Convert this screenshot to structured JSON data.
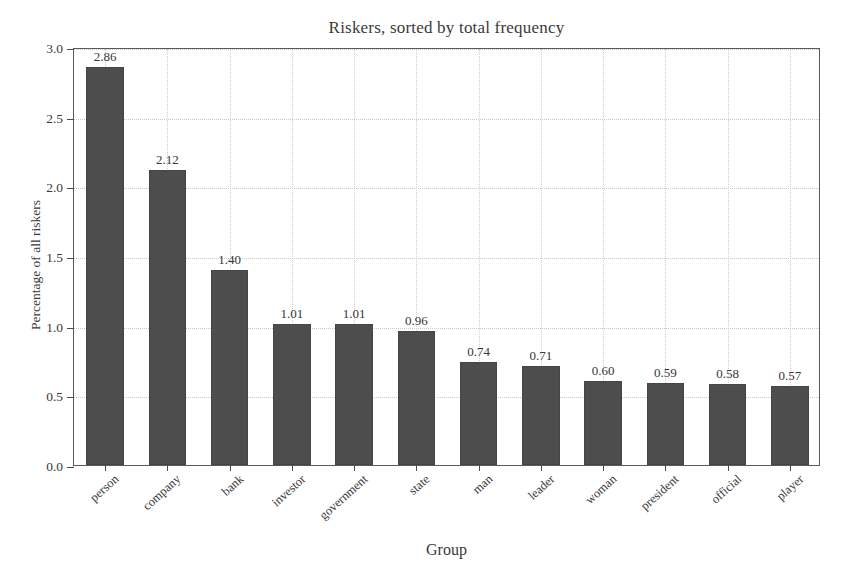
{
  "chart_data": {
    "type": "bar",
    "title": "Riskers, sorted by total frequency",
    "xlabel": "Group",
    "ylabel": "Percentage of all riskers",
    "categories": [
      "person",
      "company",
      "bank",
      "investor",
      "government",
      "state",
      "man",
      "leader",
      "woman",
      "president",
      "official",
      "player"
    ],
    "values": [
      2.86,
      2.12,
      1.4,
      1.01,
      1.01,
      0.96,
      0.74,
      0.71,
      0.6,
      0.59,
      0.58,
      0.57
    ],
    "value_labels": [
      "2.86",
      "2.12",
      "1.40",
      "1.01",
      "1.01",
      "0.96",
      "0.74",
      "0.71",
      "0.60",
      "0.59",
      "0.58",
      "0.57"
    ],
    "ylim": [
      0.0,
      3.0
    ],
    "yticks": [
      0.0,
      0.5,
      1.0,
      1.5,
      2.0,
      2.5,
      3.0
    ],
    "ytick_labels": [
      "0.0",
      "0.5",
      "1.0",
      "1.5",
      "2.0",
      "2.5",
      "3.0"
    ],
    "grid": true,
    "grid_style": "dotted",
    "legend": null,
    "bar_color": "#4d4d4d",
    "axis_color": "#595959",
    "grid_color": "#c9c9c9",
    "text_color": "#3a3a3a",
    "background": "#ffffff"
  }
}
